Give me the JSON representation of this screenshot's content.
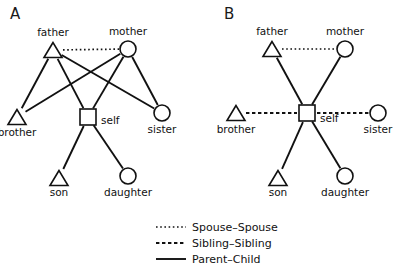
{
  "figure": {
    "background": "#ffffff",
    "stroke_color": "#111111"
  },
  "panels": [
    {
      "letter": "A",
      "letter_x": 10,
      "letter_y": 19,
      "nodes": [
        {
          "id": "father",
          "shape": "triangle",
          "label": "father",
          "x": 53,
          "y": 50,
          "label_x": 53,
          "label_y": 36,
          "label_anchor": "middle"
        },
        {
          "id": "mother",
          "shape": "circle",
          "label": "mother",
          "x": 128,
          "y": 49,
          "label_x": 128,
          "label_y": 35,
          "label_anchor": "middle"
        },
        {
          "id": "brother",
          "shape": "triangle",
          "label": "brother",
          "x": 17,
          "y": 117,
          "label_x": 17,
          "label_y": 136,
          "label_anchor": "middle"
        },
        {
          "id": "self",
          "shape": "square",
          "label": "self",
          "x": 88,
          "y": 117,
          "label_x": 101,
          "label_y": 124,
          "label_anchor": "start"
        },
        {
          "id": "sister",
          "shape": "circle",
          "label": "sister",
          "x": 162,
          "y": 113,
          "label_x": 162,
          "label_y": 133,
          "label_anchor": "middle"
        },
        {
          "id": "son",
          "shape": "triangle",
          "label": "son",
          "x": 59,
          "y": 178,
          "label_x": 59,
          "label_y": 196,
          "label_anchor": "middle"
        },
        {
          "id": "daughter",
          "shape": "circle",
          "label": "daughter",
          "x": 128,
          "y": 176,
          "label_x": 128,
          "label_y": 196,
          "label_anchor": "middle"
        }
      ],
      "edges": [
        {
          "from": "father",
          "to": "mother",
          "type": "spouse"
        },
        {
          "from": "father",
          "to": "brother",
          "type": "parent-child"
        },
        {
          "from": "father",
          "to": "self",
          "type": "parent-child"
        },
        {
          "from": "father",
          "to": "sister",
          "type": "parent-child"
        },
        {
          "from": "mother",
          "to": "brother",
          "type": "parent-child"
        },
        {
          "from": "mother",
          "to": "self",
          "type": "parent-child"
        },
        {
          "from": "mother",
          "to": "sister",
          "type": "parent-child"
        },
        {
          "from": "self",
          "to": "son",
          "type": "parent-child"
        },
        {
          "from": "self",
          "to": "daughter",
          "type": "parent-child"
        }
      ]
    },
    {
      "letter": "B",
      "letter_x": 224,
      "letter_y": 19,
      "nodes": [
        {
          "id": "father",
          "shape": "triangle",
          "label": "father",
          "x": 272,
          "y": 49,
          "label_x": 272,
          "label_y": 35,
          "label_anchor": "middle"
        },
        {
          "id": "mother",
          "shape": "circle",
          "label": "mother",
          "x": 345,
          "y": 49,
          "label_x": 345,
          "label_y": 35,
          "label_anchor": "middle"
        },
        {
          "id": "brother",
          "shape": "triangle",
          "label": "brother",
          "x": 236,
          "y": 113,
          "label_x": 236,
          "label_y": 133,
          "label_anchor": "middle"
        },
        {
          "id": "self",
          "shape": "square",
          "label": "self",
          "x": 307,
          "y": 113,
          "label_x": 320,
          "label_y": 122,
          "label_anchor": "start"
        },
        {
          "id": "sister",
          "shape": "circle",
          "label": "sister",
          "x": 378,
          "y": 113,
          "label_x": 378,
          "label_y": 133,
          "label_anchor": "middle"
        },
        {
          "id": "son",
          "shape": "triangle",
          "label": "son",
          "x": 278,
          "y": 178,
          "label_x": 278,
          "label_y": 196,
          "label_anchor": "middle"
        },
        {
          "id": "daughter",
          "shape": "circle",
          "label": "daughter",
          "x": 345,
          "y": 176,
          "label_x": 345,
          "label_y": 196,
          "label_anchor": "middle"
        }
      ],
      "edges": [
        {
          "from": "father",
          "to": "mother",
          "type": "spouse"
        },
        {
          "from": "father",
          "to": "self",
          "type": "parent-child"
        },
        {
          "from": "mother",
          "to": "self",
          "type": "parent-child"
        },
        {
          "from": "brother",
          "to": "self",
          "type": "sibling"
        },
        {
          "from": "self",
          "to": "sister",
          "type": "sibling"
        },
        {
          "from": "self",
          "to": "son",
          "type": "parent-child"
        },
        {
          "from": "self",
          "to": "daughter",
          "type": "parent-child"
        }
      ]
    }
  ],
  "legend": {
    "x_line_start": 156,
    "x_line_end": 186,
    "x_text": 192,
    "items": [
      {
        "label": "Spouse–Spouse",
        "type": "spouse",
        "y": 231
      },
      {
        "label": "Sibling–Sibling",
        "type": "sibling",
        "y": 247
      },
      {
        "label": "Parent–Child",
        "type": "parent-child",
        "y": 263
      }
    ]
  },
  "shape_sizes": {
    "triangle_half_width": 9,
    "triangle_height": 15,
    "circle_radius": 8,
    "square_half": 8
  }
}
